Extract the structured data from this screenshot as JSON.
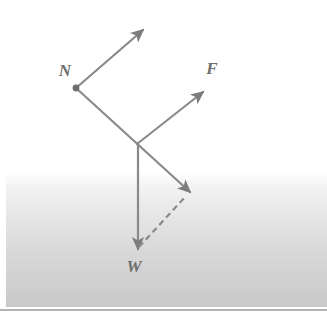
{
  "diagram": {
    "type": "force-vector-diagram",
    "canvas": {
      "width": 327,
      "height": 318
    },
    "colors": {
      "background": "#ffffff",
      "vector_line": "#8a8a8a",
      "vector_line_dark": "#7c7c7c",
      "label_text": "#6e6e6e",
      "ground_fill_top": "#ffffff",
      "ground_fill_bottom": "#c9c9c9",
      "ground_baseline": "#9a9a9a"
    },
    "origin_point": {
      "name": "vertex-dot",
      "x": 76,
      "y": 88
    },
    "crossing_point": {
      "name": "vector-crossing",
      "x": 138,
      "y": 143
    },
    "vectors": [
      {
        "id": "normal-force",
        "label": "N",
        "label_x": 65,
        "label_y": 76,
        "from": {
          "x": 76,
          "y": 88
        },
        "to": {
          "x": 143,
          "y": 30
        },
        "style": "solid",
        "arrowhead": true
      },
      {
        "id": "friction-force",
        "label": "F",
        "label_x": 212,
        "label_y": 74,
        "from": {
          "x": 137,
          "y": 144
        },
        "to": {
          "x": 203,
          "y": 92
        },
        "style": "solid",
        "arrowhead": true
      },
      {
        "id": "weight-force",
        "label": "W",
        "label_x": 134,
        "label_y": 272,
        "from": {
          "x": 138,
          "y": 143
        },
        "to": {
          "x": 138,
          "y": 249
        },
        "style": "solid",
        "arrowhead": true
      },
      {
        "id": "resultant-force",
        "label": "",
        "label_x": 0,
        "label_y": 0,
        "from": {
          "x": 76,
          "y": 88
        },
        "to": {
          "x": 190,
          "y": 192
        },
        "style": "solid",
        "arrowhead": true
      },
      {
        "id": "construction-line",
        "label": "",
        "label_x": 0,
        "label_y": 0,
        "from": {
          "x": 139,
          "y": 247
        },
        "to": {
          "x": 186,
          "y": 196
        },
        "style": "dashed",
        "arrowhead": false
      }
    ],
    "ground": {
      "id": "ground-surface",
      "top_y": 172,
      "bottom_y": 307,
      "baseline_y": 310,
      "left_x": 6,
      "right_x": 327
    }
  }
}
